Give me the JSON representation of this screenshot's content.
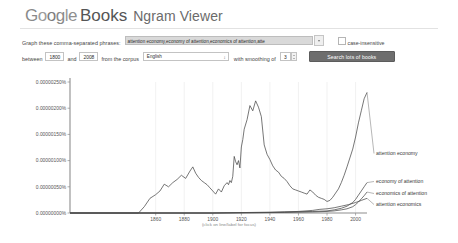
{
  "header": {
    "logo_parts": [
      "G",
      "o",
      "o",
      "g",
      "l",
      "e"
    ],
    "books_label": "Books",
    "product_label": "Ngram Viewer"
  },
  "query_row": {
    "label": "Graph these comma-separated phrases:",
    "phrases_value": "attention economy,economy of attention,economics of attention,atte",
    "phrases_placeholder": "Enter comma-separated phrases",
    "case_insensitive_label": "case-insensitive",
    "case_insensitive_checked": "false"
  },
  "options_row": {
    "between_label": "between",
    "start_year": "1800",
    "and_label": "and",
    "end_year": "2008",
    "corpus_label": "from the corpus",
    "corpus_value": "English",
    "smoothing_label": "with smoothing of",
    "smoothing_value": "3",
    "search_button": "Search lots of books"
  },
  "chart_data": {
    "type": "line",
    "title": "",
    "xlabel": "",
    "ylabel": "",
    "footnote": "(click on line/label for focus)",
    "grid": true,
    "legend_position": "right",
    "xlim": [
      1800,
      2008
    ],
    "ylim": [
      0,
      2.5e-08
    ],
    "xticks": [
      "1860",
      "1880",
      "1900",
      "1920",
      "1940",
      "1960",
      "1980",
      "2000"
    ],
    "xtick_values": [
      1860,
      1880,
      1900,
      1920,
      1940,
      1960,
      1980,
      2000
    ],
    "yticks": [
      "0.00000000%",
      "0.00000050%",
      "0.00000100%",
      "0.00000150%",
      "0.00000200%",
      "0.00000250%"
    ],
    "ytick_values": [
      0,
      5e-09,
      1e-08,
      1.5e-08,
      2e-08,
      2.5e-08
    ],
    "series": [
      {
        "name": "attention economy",
        "label_y": 155,
        "x": [
          1800,
          1820,
          1840,
          1848,
          1852,
          1856,
          1860,
          1863,
          1866,
          1869,
          1872,
          1875,
          1878,
          1881,
          1884,
          1886,
          1888,
          1890,
          1892,
          1894,
          1896,
          1898,
          1900,
          1902,
          1904,
          1906,
          1908,
          1910,
          1911,
          1912,
          1913,
          1914,
          1915,
          1916,
          1917,
          1918,
          1919,
          1920,
          1921,
          1922,
          1924,
          1926,
          1928,
          1930,
          1932,
          1934,
          1936,
          1938,
          1940,
          1942,
          1944,
          1946,
          1948,
          1950,
          1952,
          1954,
          1956,
          1958,
          1960,
          1962,
          1964,
          1966,
          1968,
          1970,
          1972,
          1974,
          1976,
          1978,
          1980,
          1982,
          1984,
          1986,
          1988,
          1990,
          1992,
          1994,
          1996,
          1998,
          2000,
          2002,
          2004,
          2006,
          2008
        ],
        "values": [
          0,
          0,
          0,
          0.0,
          0.12,
          0.28,
          0.35,
          0.42,
          0.55,
          0.5,
          0.58,
          0.64,
          0.72,
          0.66,
          0.8,
          0.88,
          0.76,
          0.68,
          0.62,
          0.58,
          0.54,
          0.48,
          0.42,
          0.36,
          0.46,
          0.4,
          0.52,
          0.58,
          0.54,
          0.62,
          0.58,
          0.7,
          1.08,
          0.98,
          0.92,
          1.0,
          0.86,
          1.26,
          1.4,
          1.6,
          1.78,
          2.05,
          1.95,
          2.14,
          2.02,
          1.84,
          1.3,
          1.12,
          1.02,
          0.9,
          0.82,
          0.78,
          0.7,
          0.66,
          0.6,
          0.52,
          0.46,
          0.44,
          0.42,
          0.4,
          0.38,
          0.36,
          0.44,
          0.4,
          0.34,
          0.3,
          0.28,
          0.26,
          0.22,
          0.24,
          0.3,
          0.38,
          0.46,
          0.58,
          0.72,
          0.88,
          1.05,
          1.22,
          1.45,
          1.72,
          1.95,
          2.18,
          2.3
        ]
      },
      {
        "name": "economy of attention",
        "label_y": 183,
        "x": [
          1800,
          1900,
          1950,
          1970,
          1980,
          1985,
          1990,
          1994,
          1998,
          2000,
          2002,
          2004,
          2006,
          2008
        ],
        "values": [
          0,
          0,
          0.02,
          0.03,
          0.04,
          0.06,
          0.09,
          0.13,
          0.2,
          0.26,
          0.34,
          0.42,
          0.5,
          0.58
        ]
      },
      {
        "name": "economics of attention",
        "label_y": 195,
        "x": [
          1800,
          1900,
          1950,
          1970,
          1980,
          1985,
          1990,
          1994,
          1998,
          2000,
          2002,
          2004,
          2006,
          2008
        ],
        "values": [
          0,
          0,
          0.01,
          0.02,
          0.03,
          0.04,
          0.06,
          0.08,
          0.12,
          0.16,
          0.21,
          0.27,
          0.33,
          0.4
        ]
      },
      {
        "name": "attention economics",
        "label_y": 206,
        "x": [
          1800,
          1900,
          1940,
          1950,
          1960,
          1970,
          1975,
          1980,
          1985,
          1990,
          1995,
          2000,
          2004,
          2008
        ],
        "values": [
          0,
          0,
          0.01,
          0.02,
          0.03,
          0.05,
          0.07,
          0.08,
          0.1,
          0.13,
          0.16,
          0.2,
          0.24,
          0.28
        ]
      }
    ]
  }
}
